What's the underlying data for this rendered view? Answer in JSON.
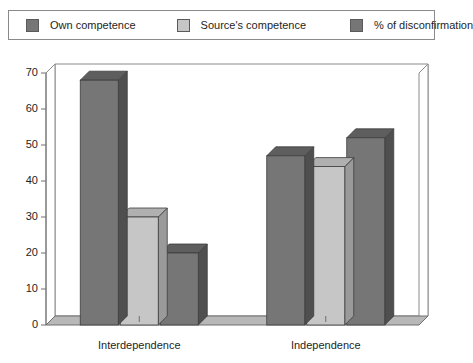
{
  "legend": {
    "entries": [
      {
        "label": "Own competence",
        "color": "#767676",
        "swatch_name": "legend-swatch-own-competence"
      },
      {
        "label": "Source's competence",
        "color": "#c6c6c6",
        "swatch_name": "legend-swatch-source-competence"
      },
      {
        "label": "% of disconfirmation",
        "color": "#767676",
        "swatch_name": "legend-swatch-disconfirmation"
      }
    ]
  },
  "chart_data": {
    "type": "bar",
    "title": "",
    "xlabel": "",
    "ylabel": "",
    "categories": [
      "Interdependence",
      "Independence"
    ],
    "series": [
      {
        "name": "Own competence",
        "color": "#767676",
        "values": [
          68,
          47
        ]
      },
      {
        "name": "Source's competence",
        "color": "#c6c6c6",
        "values": [
          30,
          44
        ]
      },
      {
        "name": "% of disconfirmation",
        "color": "#767676",
        "values": [
          20,
          52
        ]
      }
    ],
    "ylim": [
      0,
      70
    ],
    "yticks": [
      0,
      10,
      20,
      30,
      40,
      50,
      60,
      70
    ],
    "ytick_labels": [
      "0",
      "10",
      "20",
      "30",
      "40",
      "50",
      "60",
      "70"
    ],
    "grid": false,
    "legend_position": "top",
    "style": "3d-column"
  },
  "colors": {
    "dark_bar_front": "#767676",
    "dark_bar_top": "#5e5e5e",
    "dark_bar_side": "#4f4f4f",
    "light_bar_front": "#c6c6c6",
    "light_bar_top": "#b0b0b0",
    "light_bar_side": "#9a9a9a",
    "floor": "#b8b8b8",
    "axis_line": "#6e6e6e",
    "frame_line": "#8a8a8a",
    "background": "#ffffff"
  }
}
